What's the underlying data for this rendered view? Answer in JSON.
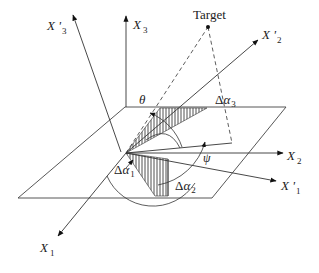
{
  "labels": {
    "target": "Target",
    "x1": {
      "base": "X",
      "sub": "1"
    },
    "x2": {
      "base": "X",
      "sub": "2"
    },
    "x3": {
      "base": "X",
      "sub": "3"
    },
    "x1p": {
      "base": "X '",
      "sub": "1"
    },
    "x2p": {
      "base": "X '",
      "sub": "2"
    },
    "x3p": {
      "base": "X '",
      "sub": "3"
    },
    "theta": "θ",
    "psi": "ψ",
    "da1": {
      "delta": "Δ",
      "alpha": "α",
      "sub": "1"
    },
    "da2": {
      "delta": "Δ",
      "alpha": "α",
      "sub": "2"
    },
    "da3": {
      "delta": "Δ",
      "alpha": "α",
      "sub": "3"
    }
  },
  "colors": {
    "line": "#333333",
    "background": "#ffffff"
  }
}
